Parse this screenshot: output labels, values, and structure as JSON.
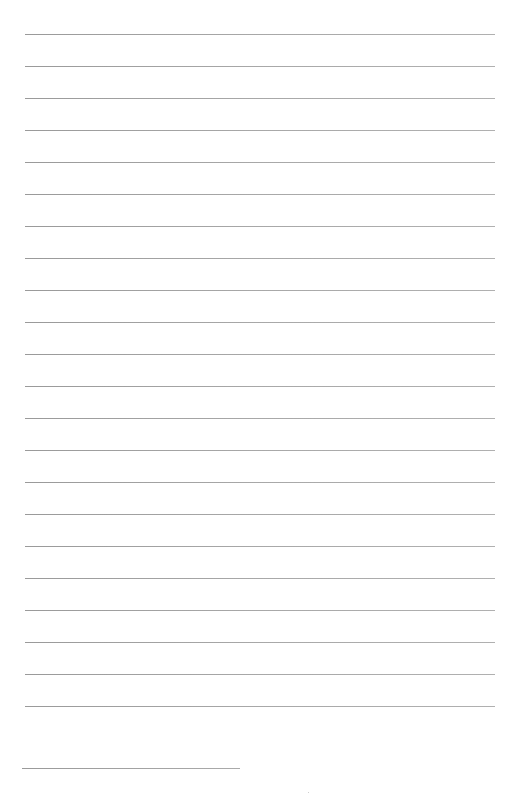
{
  "page": {
    "type": "lined-paper",
    "background_color": "#ffffff",
    "rule_color": "#a4a4a4",
    "rules": {
      "count": 22,
      "start_y": 34,
      "spacing": 32,
      "left": 25,
      "right": 495
    },
    "short_rule": {
      "y": 768,
      "left": 22,
      "right": 240
    }
  }
}
